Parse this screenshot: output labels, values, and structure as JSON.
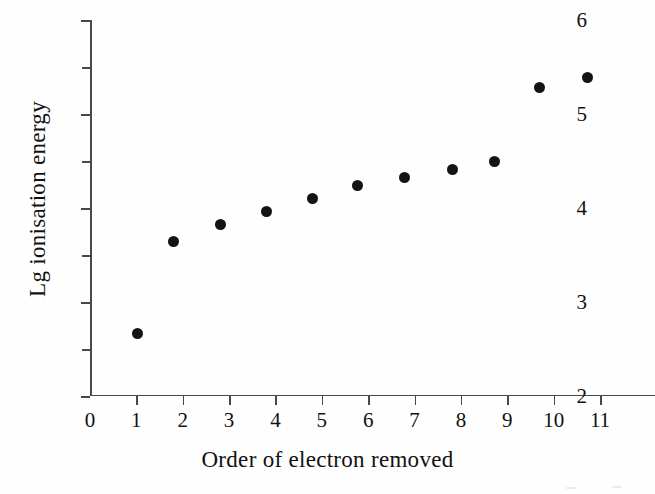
{
  "chart_data": {
    "type": "scatter",
    "title": "",
    "xlabel": "Order of electron removed",
    "ylabel": "Lg ionisation energy",
    "xlim": [
      0,
      11
    ],
    "ylim": [
      2,
      6
    ],
    "grid": false,
    "legend": null,
    "x_ticks": [
      0,
      1,
      2,
      3,
      4,
      5,
      6,
      7,
      8,
      9,
      10,
      11
    ],
    "x_tick_labels": [
      "0",
      "1",
      "2",
      "3",
      "4",
      "5",
      "6",
      "7",
      "8",
      "9",
      "10",
      "11"
    ],
    "y_ticks": [
      2,
      3,
      4,
      5,
      6
    ],
    "y_tick_labels": [
      "2",
      "3",
      "4",
      "5",
      "6"
    ],
    "y_minor_ticks": [
      2.5,
      3.5,
      4.5,
      5.5
    ],
    "marker": "filled-circle",
    "marker_color": "#141414",
    "axis_color": "#484848",
    "background_color": "#fefefe",
    "points": [
      {
        "x": 1.02,
        "y": 2.67
      },
      {
        "x": 1.81,
        "y": 3.64
      },
      {
        "x": 2.82,
        "y": 3.82
      },
      {
        "x": 3.81,
        "y": 3.96
      },
      {
        "x": 4.79,
        "y": 4.1
      },
      {
        "x": 5.78,
        "y": 4.24
      },
      {
        "x": 6.79,
        "y": 4.32
      },
      {
        "x": 7.81,
        "y": 4.41
      },
      {
        "x": 8.73,
        "y": 4.49
      },
      {
        "x": 9.7,
        "y": 5.28
      },
      {
        "x": 10.72,
        "y": 5.39
      }
    ],
    "x": [
      1.02,
      1.81,
      2.82,
      3.81,
      4.79,
      5.78,
      6.79,
      7.81,
      8.73,
      9.7,
      10.72
    ],
    "values": [
      2.67,
      3.64,
      3.82,
      3.96,
      4.1,
      4.24,
      4.32,
      4.41,
      4.49,
      5.28,
      5.39
    ]
  }
}
